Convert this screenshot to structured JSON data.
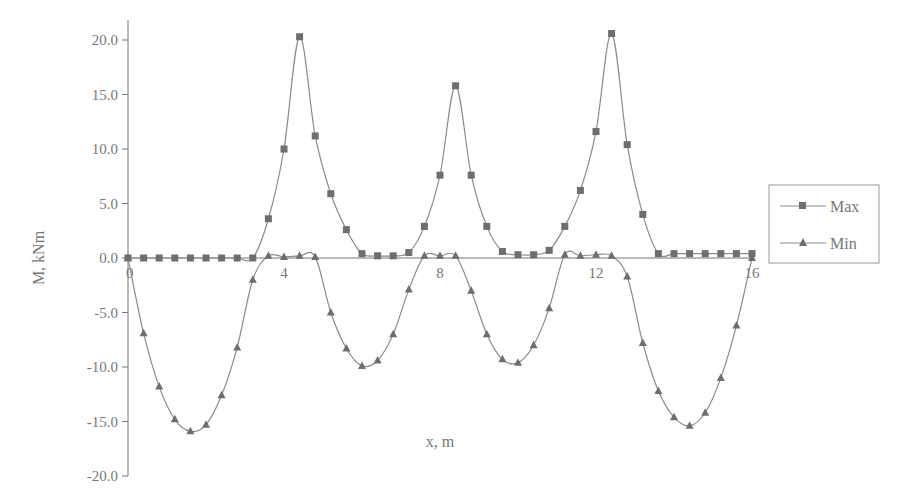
{
  "chart_data": {
    "type": "line",
    "title": "",
    "xlabel": "x, m",
    "ylabel": "M, kNm",
    "xlim": [
      0,
      16
    ],
    "ylim": [
      -20,
      20
    ],
    "x_ticks": [
      "0",
      "4",
      "8",
      "12",
      "16"
    ],
    "y_ticks": [
      "20.0",
      "15.0",
      "10.0",
      "5.0",
      "0.0",
      "-5.0",
      "-10.0",
      "-15.0",
      "-20.0"
    ],
    "grid": false,
    "legend_position": "right",
    "x": [
      0,
      0.4,
      0.8,
      1.2,
      1.6,
      2.0,
      2.4,
      2.8,
      3.2,
      3.6,
      4.0,
      4.4,
      4.8,
      5.2,
      5.6,
      6.0,
      6.4,
      6.8,
      7.2,
      7.6,
      8.0,
      8.4,
      8.8,
      9.2,
      9.6,
      10.0,
      10.4,
      10.8,
      11.2,
      11.6,
      12.0,
      12.4,
      12.8,
      13.2,
      13.6,
      14.0,
      14.4,
      14.8,
      15.2,
      15.6,
      16.0
    ],
    "series": [
      {
        "name": "Max",
        "marker": "square",
        "values": [
          0.0,
          0.0,
          0.0,
          0.0,
          0.0,
          0.0,
          0.0,
          0.0,
          0.0,
          3.6,
          10.0,
          20.3,
          11.2,
          5.9,
          2.6,
          0.4,
          0.2,
          0.2,
          0.5,
          2.9,
          7.6,
          15.8,
          7.6,
          2.9,
          0.6,
          0.3,
          0.3,
          0.7,
          2.9,
          6.2,
          11.6,
          20.6,
          10.4,
          4.0,
          0.4,
          0.4,
          0.4,
          0.4,
          0.4,
          0.4,
          0.4
        ]
      },
      {
        "name": "Min",
        "marker": "triangle",
        "values": [
          0.0,
          -6.9,
          -11.8,
          -14.8,
          -15.9,
          -15.3,
          -12.6,
          -8.2,
          -2.0,
          0.2,
          0.1,
          0.2,
          0.1,
          -5.0,
          -8.3,
          -9.9,
          -9.4,
          -7.0,
          -2.9,
          0.2,
          0.2,
          0.2,
          -3.0,
          -7.0,
          -9.3,
          -9.6,
          -8.0,
          -4.6,
          0.3,
          0.2,
          0.3,
          0.2,
          -1.7,
          -7.8,
          -12.2,
          -14.6,
          -15.4,
          -14.2,
          -11.0,
          -6.2,
          0.0
        ]
      }
    ],
    "_note": "x values: markers at 0.4 m spacing; Max peaks at x=4,8,12 (indices shifted for plotting)"
  },
  "legend": {
    "items": [
      {
        "label": "Max",
        "marker": "square"
      },
      {
        "label": "Min",
        "marker": "triangle"
      }
    ]
  },
  "colors": {
    "line": "#8a8a8a",
    "marker": "#6e6e6e",
    "axis": "#777777",
    "text": "#777777"
  }
}
